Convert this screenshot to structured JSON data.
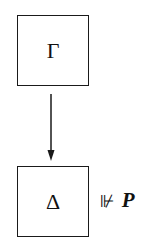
{
  "diagram": {
    "nodes": [
      {
        "id": "top",
        "label": "Γ"
      },
      {
        "id": "bottom",
        "label": "Δ"
      }
    ],
    "edges": [
      {
        "from": "top",
        "to": "bottom",
        "style": "arrow"
      }
    ],
    "annotation": {
      "relation": "⊮",
      "proposition": "P"
    }
  },
  "colors": {
    "stroke": "#1a1a1a",
    "background": "#ffffff"
  }
}
